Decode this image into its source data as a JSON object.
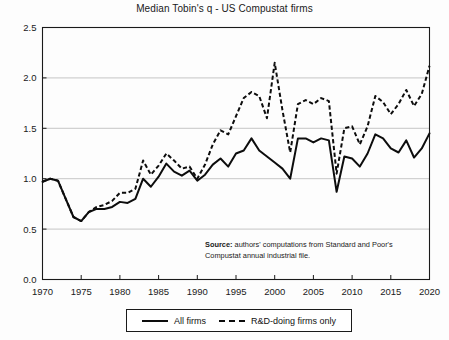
{
  "chart_data": {
    "type": "line",
    "title": "Median Tobin's q - US Compustat firms",
    "xlabel": "",
    "ylabel": "",
    "xlim": [
      1970,
      2020
    ],
    "ylim": [
      0.0,
      2.5
    ],
    "grid": true,
    "legend_position": "below-axes",
    "xticks": [
      1970,
      1975,
      1980,
      1985,
      1990,
      1995,
      2000,
      2005,
      2010,
      2015,
      2020
    ],
    "yticks": [
      "0.0",
      "0.5",
      "1.0",
      "1.5",
      "2.0",
      "2.5"
    ],
    "x": [
      1970,
      1971,
      1972,
      1973,
      1974,
      1975,
      1976,
      1977,
      1978,
      1979,
      1980,
      1981,
      1982,
      1983,
      1984,
      1985,
      1986,
      1987,
      1988,
      1989,
      1990,
      1991,
      1992,
      1993,
      1994,
      1995,
      1996,
      1997,
      1998,
      1999,
      2000,
      2001,
      2002,
      2003,
      2004,
      2005,
      2006,
      2007,
      2008,
      2009,
      2010,
      2011,
      2012,
      2013,
      2014,
      2015,
      2016,
      2017,
      2018,
      2019,
      2020
    ],
    "series": [
      {
        "name": "All firms",
        "style": "solid",
        "values": [
          0.97,
          1.0,
          0.98,
          0.8,
          0.62,
          0.58,
          0.67,
          0.7,
          0.7,
          0.72,
          0.77,
          0.76,
          0.8,
          1.0,
          0.92,
          1.02,
          1.15,
          1.07,
          1.03,
          1.08,
          0.98,
          1.04,
          1.14,
          1.2,
          1.12,
          1.25,
          1.28,
          1.4,
          1.28,
          1.22,
          1.16,
          1.1,
          1.0,
          1.4,
          1.4,
          1.36,
          1.4,
          1.38,
          0.87,
          1.22,
          1.2,
          1.12,
          1.25,
          1.44,
          1.4,
          1.3,
          1.26,
          1.38,
          1.21,
          1.3,
          1.45
        ]
      },
      {
        "name": "R&D-doing firms only",
        "style": "dashed",
        "values": [
          0.97,
          1.0,
          0.98,
          0.8,
          0.62,
          0.58,
          0.67,
          0.72,
          0.74,
          0.78,
          0.86,
          0.86,
          0.9,
          1.18,
          1.04,
          1.13,
          1.25,
          1.18,
          1.1,
          1.12,
          1.0,
          1.14,
          1.34,
          1.48,
          1.44,
          1.62,
          1.8,
          1.86,
          1.82,
          1.6,
          2.15,
          1.68,
          1.26,
          1.74,
          1.78,
          1.74,
          1.8,
          1.77,
          1.05,
          1.5,
          1.52,
          1.34,
          1.52,
          1.82,
          1.76,
          1.64,
          1.74,
          1.88,
          1.72,
          1.84,
          2.12
        ]
      }
    ],
    "annotation": {
      "label": "Source:",
      "text": " authors' computations from Standard and Poor's Compustat annual industrial file."
    }
  },
  "legend": {
    "entries": [
      {
        "label": "All firms"
      },
      {
        "label": "R&D-doing firms only"
      }
    ]
  }
}
